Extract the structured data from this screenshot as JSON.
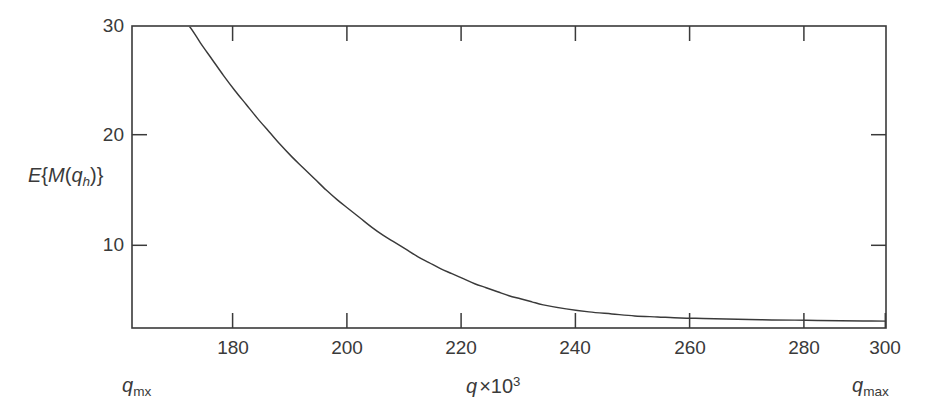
{
  "figure": {
    "background_color": "#ffffff",
    "line_color": "#3a3a3a",
    "axis_color": "#3a3a3a"
  },
  "axes": {
    "y_title_parts": {
      "e": "E",
      "brace_open": "{",
      "m": "M",
      "paren_open": "(",
      "q": "q",
      "sub_h": "h",
      "paren_close": ")",
      "brace_close": "}"
    },
    "x_title_parts": {
      "q": "q",
      "times": "×10",
      "exp": "3"
    },
    "y_ticks": [
      {
        "value": 10,
        "label": "10"
      },
      {
        "value": 20,
        "label": "20"
      },
      {
        "value": 30,
        "label": "30"
      }
    ],
    "x_ticks": [
      {
        "value": 180,
        "label": "180"
      },
      {
        "value": 200,
        "label": "200"
      },
      {
        "value": 220,
        "label": "220"
      },
      {
        "value": 240,
        "label": "240"
      },
      {
        "value": 260,
        "label": "260"
      },
      {
        "value": 280,
        "label": "280"
      },
      {
        "value": 300,
        "label": "300"
      }
    ],
    "endpoint_left": {
      "q": "q",
      "sub": "mx"
    },
    "endpoint_right": {
      "q": "q",
      "sub": "max"
    }
  },
  "chart_data": {
    "type": "line",
    "title": "",
    "subtitle": "",
    "xlabel": "q ×10³",
    "ylabel": "E{M(q_h)}",
    "xlim": [
      168,
      300
    ],
    "ylim": [
      0,
      30
    ],
    "grid": false,
    "legend": null,
    "x_tick_values": [
      180,
      200,
      220,
      240,
      260,
      280,
      300
    ],
    "x_tick_labels": [
      "180",
      "200",
      "220",
      "240",
      "260",
      "280",
      "300"
    ],
    "y_tick_values": [
      10,
      20,
      30
    ],
    "y_tick_labels": [
      "10",
      "20",
      "30"
    ],
    "annotations": [
      {
        "text": "q_mx",
        "position": "below-axis-left",
        "x": 172
      },
      {
        "text": "q_max",
        "position": "below-axis-right",
        "x": 300
      }
    ],
    "series": [
      {
        "name": "E{M(q_h)}",
        "x": [
          174,
          176,
          178,
          180,
          182,
          184,
          186,
          188,
          190,
          192,
          194,
          196,
          198,
          200,
          202,
          204,
          206,
          208,
          210,
          212,
          214,
          216,
          218,
          220,
          222,
          224,
          226,
          228,
          230,
          232,
          234,
          236,
          238,
          240,
          244,
          248,
          252,
          256,
          260,
          264,
          268,
          272,
          276,
          280,
          284,
          288,
          292,
          296,
          300
        ],
        "y": [
          31.8,
          30.9,
          30.0,
          28.3,
          26.7,
          25.1,
          23.6,
          22.2,
          20.8,
          19.5,
          18.2,
          17.0,
          15.9,
          14.8,
          13.7,
          12.7,
          11.8,
          10.9,
          10.0,
          9.2,
          8.5,
          7.8,
          7.1,
          6.5,
          5.9,
          5.4,
          4.9,
          4.4,
          4.0,
          3.6,
          3.2,
          2.9,
          2.6,
          2.3,
          1.9,
          1.6,
          1.4,
          1.2,
          1.1,
          1.0,
          0.95,
          0.9,
          0.85,
          0.8,
          0.78,
          0.75,
          0.72,
          0.7,
          0.68
        ]
      }
    ]
  },
  "geometry": {
    "plot_left": 132,
    "plot_right": 886,
    "plot_top": 26,
    "plot_bottom": 328
  }
}
